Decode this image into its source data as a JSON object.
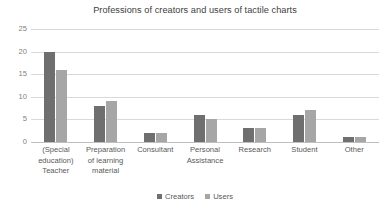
{
  "chart_data": {
    "type": "bar",
    "title": "Professions of creators and users of tactile charts",
    "xlabel": "",
    "ylabel": "",
    "ylim": [
      0,
      25
    ],
    "ytick_step": 5,
    "yticks": [
      "0",
      "5",
      "10",
      "15",
      "20",
      "25"
    ],
    "grid": true,
    "legend_position": "bottom-center",
    "categories": [
      "(Special education) Teacher",
      "Preparation of learning material",
      "Consultant",
      "Personal Assistance",
      "Research",
      "Student",
      "Other"
    ],
    "category_lines": [
      [
        "(Special",
        "education)",
        "Teacher"
      ],
      [
        "Preparation",
        "of learning",
        "material"
      ],
      [
        "Consultant"
      ],
      [
        "Personal",
        "Assistance"
      ],
      [
        "Research"
      ],
      [
        "Student"
      ],
      [
        "Other"
      ]
    ],
    "series": [
      {
        "name": "Creators",
        "color": "#6F6F6F",
        "values": [
          20,
          8,
          2,
          6,
          3,
          6,
          1
        ]
      },
      {
        "name": "Users",
        "color": "#A6A6A6",
        "values": [
          16,
          9,
          2,
          5,
          3,
          7,
          1
        ]
      }
    ]
  },
  "colors": {
    "background": "#FFFFFF",
    "gridline": "#D9D9D9",
    "baseline": "#BFBFBF",
    "title_text": "#404040",
    "axis_text": "#595959",
    "ytick_text": "#7F7F7F"
  }
}
